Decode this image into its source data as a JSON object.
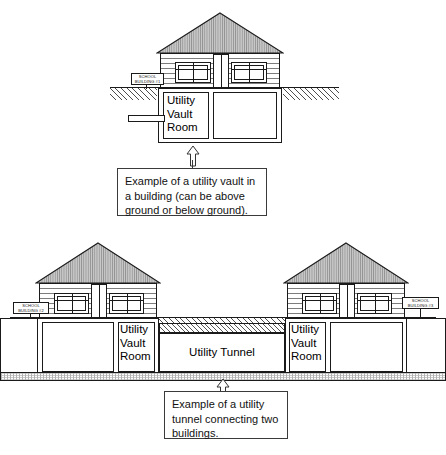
{
  "diagram": {
    "colors": {
      "line": "#1a1a1a",
      "roof_fill": "#b3b3b3",
      "background": "#ffffff",
      "hatch": "#555555"
    },
    "top_figure": {
      "sign_line1": "SCHOOL",
      "sign_line2": "BUILDING #1",
      "vault_label": "Utility\nVault\nRoom",
      "callout_text": "Example of a utility vault in\na building (can be above\nground or below ground)."
    },
    "bottom_figure": {
      "left_sign_line1": "SCHOOL",
      "left_sign_line2": "BUILDING #2",
      "right_sign_line1": "SCHOOL",
      "right_sign_line2": "BUILDING #3",
      "left_vault_label": "Utility\nVault\nRoom",
      "right_vault_label": "Utility\nVault\nRoom",
      "tunnel_label": "Utility Tunnel",
      "callout_text": "Example of a utility\ntunnel connecting two\nbuildings."
    }
  }
}
